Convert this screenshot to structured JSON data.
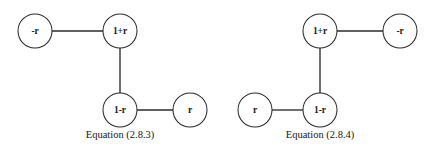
{
  "figure": {
    "background_color": "#ffffff",
    "stroke_color": "#2b2b2b",
    "text_color": "#161616",
    "node_fill": "#ffffff",
    "node_radius": 17,
    "diagrams": [
      {
        "id": "equation-2-8-3",
        "caption": "Equation (2.8.3)",
        "caption_x": 120,
        "caption_y": 136,
        "nodes": [
          {
            "id": "left-top-minus-r",
            "label": "-r",
            "cx": 35,
            "cy": 31
          },
          {
            "id": "left-top-one-plus-r",
            "label": "1+r",
            "cx": 120,
            "cy": 31
          },
          {
            "id": "left-bottom-one-minus-r",
            "label": "1-r",
            "cx": 120,
            "cy": 110
          },
          {
            "id": "left-bottom-r",
            "label": "r",
            "cx": 190,
            "cy": 110
          }
        ],
        "edges": [
          {
            "id": "edge-minus-r-to-one-plus-r",
            "x1": 52,
            "y1": 31,
            "x2": 103,
            "y2": 31
          },
          {
            "id": "edge-one-plus-r-to-one-minus-r",
            "x1": 120,
            "y1": 48,
            "x2": 120,
            "y2": 93
          },
          {
            "id": "edge-one-minus-r-to-r",
            "x1": 137,
            "y1": 110,
            "x2": 173,
            "y2": 110
          }
        ]
      },
      {
        "id": "equation-2-8-4",
        "caption": "Equation (2.8.4)",
        "caption_x": 320,
        "caption_y": 136,
        "nodes": [
          {
            "id": "right-top-one-plus-r",
            "label": "1+r",
            "cx": 320,
            "cy": 31
          },
          {
            "id": "right-top-minus-r",
            "label": "-r",
            "cx": 400,
            "cy": 31
          },
          {
            "id": "right-bottom-r",
            "label": "r",
            "cx": 255,
            "cy": 110
          },
          {
            "id": "right-bottom-one-minus-r",
            "label": "1-r",
            "cx": 320,
            "cy": 110
          }
        ],
        "edges": [
          {
            "id": "edge-one-plus-r-to-minus-r",
            "x1": 337,
            "y1": 31,
            "x2": 383,
            "y2": 31
          },
          {
            "id": "edge-one-plus-r-to-one-minus-r-right",
            "x1": 320,
            "y1": 48,
            "x2": 320,
            "y2": 93
          },
          {
            "id": "edge-r-to-one-minus-r",
            "x1": 272,
            "y1": 110,
            "x2": 303,
            "y2": 110
          }
        ]
      }
    ]
  }
}
